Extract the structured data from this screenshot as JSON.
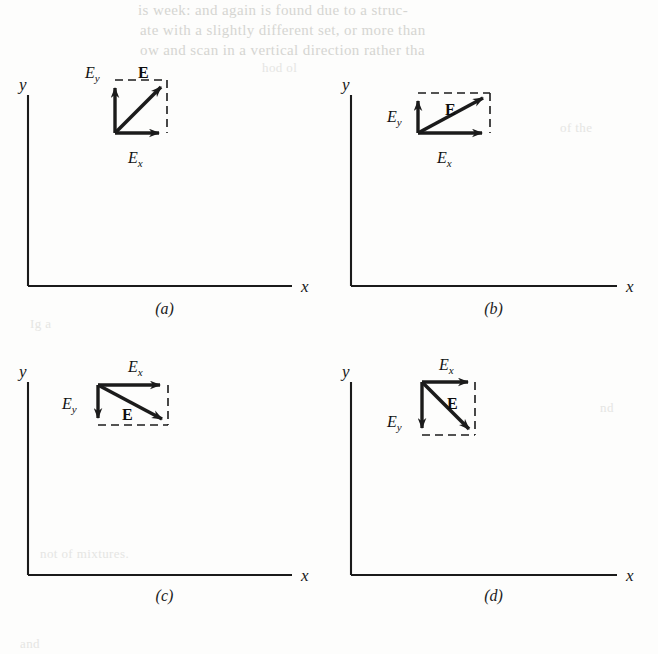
{
  "figure": {
    "type": "vector-decomposition-figure",
    "background_color": "#fdfdfc",
    "ink_color": "#1b1b1b",
    "panel_count": 4
  },
  "ghost_text": {
    "line1": "is week: and again is found due to a struc-",
    "line2": "ate with a slightly different set, or more than",
    "line3": "ow and scan in a vertical direction rather tha",
    "line4": "hod ol",
    "line5": "Ig a",
    "line6": "not of mixtures.",
    "line7": "of the",
    "line8": "nd",
    "line9": "and"
  },
  "panels": [
    {
      "id": "a",
      "caption": "(a)",
      "axis": {
        "y_label": "y",
        "x_label": "x"
      },
      "vectors": {
        "resultant": {
          "label": "E",
          "bold": true,
          "dx": 52,
          "dy": -53
        },
        "x_component": {
          "label": "E",
          "subscript": "x",
          "direction": "right",
          "length": 52
        },
        "y_component": {
          "label": "E",
          "subscript": "y",
          "direction": "up",
          "length": 53
        }
      },
      "box": {
        "width": 52,
        "height": 53,
        "dashed_sides": "top-right"
      }
    },
    {
      "id": "b",
      "caption": "(b)",
      "axis": {
        "y_label": "y",
        "x_label": "x"
      },
      "vectors": {
        "resultant": {
          "label": "E",
          "bold": true,
          "dx": 72,
          "dy": -40
        },
        "x_component": {
          "label": "E",
          "subscript": "x",
          "direction": "right",
          "length": 72
        },
        "y_component": {
          "label": "E",
          "subscript": "y",
          "direction": "up",
          "length": 40
        }
      },
      "box": {
        "width": 72,
        "height": 40,
        "dashed_sides": "top-right"
      }
    },
    {
      "id": "c",
      "caption": "(c)",
      "axis": {
        "y_label": "y",
        "x_label": "x"
      },
      "vectors": {
        "resultant": {
          "label": "E",
          "bold": true,
          "dx": 70,
          "dy": 40
        },
        "x_component": {
          "label": "E",
          "subscript": "x",
          "direction": "right",
          "length": 70
        },
        "y_component": {
          "label": "E",
          "subscript": "y",
          "direction": "down",
          "length": 40
        }
      },
      "box": {
        "width": 70,
        "height": 40,
        "dashed_sides": "bottom-right"
      }
    },
    {
      "id": "d",
      "caption": "(d)",
      "axis": {
        "y_label": "y",
        "x_label": "x"
      },
      "vectors": {
        "resultant": {
          "label": "E",
          "bold": true,
          "dx": 53,
          "dy": 53
        },
        "x_component": {
          "label": "E",
          "subscript": "x",
          "direction": "right",
          "length": 53
        },
        "y_component": {
          "label": "E",
          "subscript": "y",
          "direction": "down",
          "length": 53
        }
      },
      "box": {
        "width": 53,
        "height": 53,
        "dashed_sides": "bottom-right"
      }
    }
  ]
}
